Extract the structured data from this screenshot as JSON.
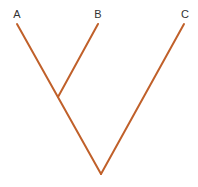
{
  "diagram": {
    "type": "cladogram",
    "line_color": "#c0602a",
    "taxa": [
      {
        "label": "A",
        "tip": [
          17,
          24
        ],
        "label_pos": [
          17,
          18
        ]
      },
      {
        "label": "B",
        "tip": [
          98,
          24
        ],
        "label_pos": [
          98,
          18
        ]
      },
      {
        "label": "C",
        "tip": [
          184,
          24
        ],
        "label_pos": [
          185,
          18
        ]
      }
    ],
    "nodes": {
      "ab_junction": [
        58,
        97
      ],
      "root": [
        101,
        174
      ]
    }
  }
}
